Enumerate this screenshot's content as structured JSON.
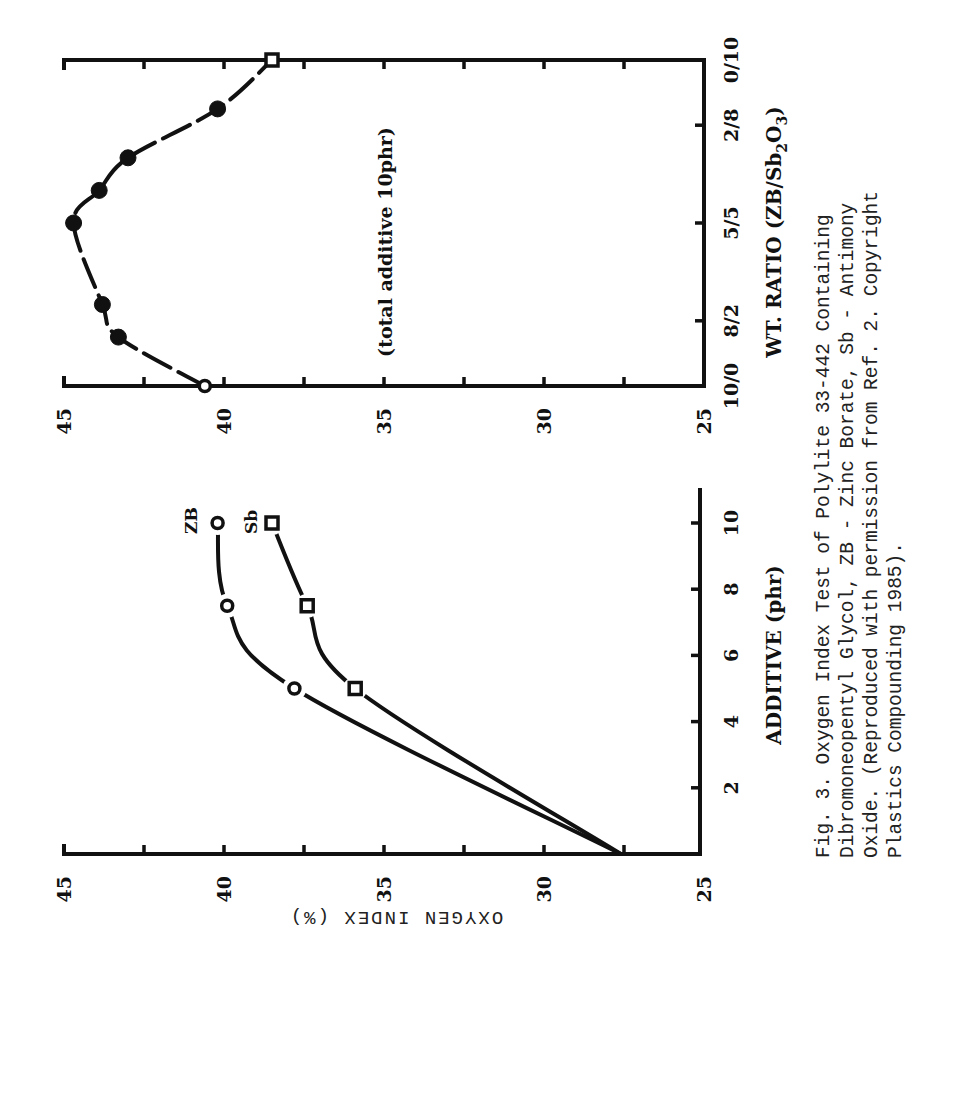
{
  "figure": {
    "caption_lines": [
      "Fig. 3. Oxygen  Index  Test  of  Polylite  33-442  Containing",
      "Dibromoneopentyl Glycol,  ZB  -  Zinc  Borate,  Sb  -  Antimony",
      "Oxide.   (Reproduced with permission from Ref.  2.   Copyright",
      "Plastics Compounding 1985)."
    ],
    "shared_ylabel": "OXYGEN INDEX (%)"
  },
  "chart_data": [
    {
      "type": "line",
      "id": "additive-chart",
      "title": "",
      "xlabel": "ADDITIVE (phr)",
      "ylabel": "OXYGEN INDEX (%)",
      "x_ticks": [
        "2",
        "4",
        "6",
        "8",
        "10"
      ],
      "y_ticks": [
        "45",
        "40",
        "35",
        "30",
        "25"
      ],
      "xlim": [
        0,
        11
      ],
      "ylim": [
        25,
        45
      ],
      "grid": false,
      "series": [
        {
          "name": "ZB",
          "label": "ZB",
          "marker": "open-circle",
          "x": [
            0,
            5,
            7.5,
            10
          ],
          "y": [
            27.6,
            37.8,
            39.9,
            40.2
          ]
        },
        {
          "name": "Sb",
          "label": "Sb",
          "marker": "open-square",
          "x": [
            0,
            5,
            7.5,
            10
          ],
          "y": [
            27.6,
            35.9,
            37.4,
            38.5
          ]
        }
      ]
    },
    {
      "type": "line",
      "id": "ratio-chart",
      "title": "",
      "xlabel": "WT. RATIO (ZB/Sb2O3)",
      "xlabel_main": "WT. RATIO (ZB/Sb",
      "xlabel_sub1": "2",
      "xlabel_mid": "O",
      "xlabel_sub2": "3",
      "xlabel_end": ")",
      "ylabel": "OXYGEN INDEX (%)",
      "annotation": "(total additive 10phr)",
      "x_ticks": [
        "10/0",
        "8/2",
        "5/5",
        "2/8",
        "0/10"
      ],
      "y_ticks": [
        "45",
        "40",
        "35",
        "30",
        "25"
      ],
      "ylim": [
        25,
        45
      ],
      "grid": false,
      "series": [
        {
          "name": "ZB/Sb2O3 blend",
          "x_sb_parts": [
            0,
            1.5,
            2.5,
            5,
            6,
            7,
            8.5,
            10
          ],
          "x_labels": [
            "10/0",
            "8.5/1.5",
            "7.5/2.5",
            "5/5",
            "4/6",
            "3/7",
            "1.5/8.5",
            "0/10"
          ],
          "y": [
            40.6,
            43.3,
            43.8,
            44.7,
            43.9,
            43.0,
            40.2,
            38.5
          ],
          "markers": [
            "open-circle",
            "filled-circle",
            "filled-circle",
            "filled-circle",
            "filled-circle",
            "filled-circle",
            "filled-circle",
            "open-square"
          ]
        }
      ]
    }
  ]
}
